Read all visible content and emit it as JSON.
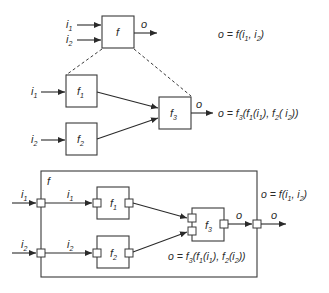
{
  "diagram": {
    "type": "function-composition-block-diagram",
    "panel_top": {
      "block": {
        "label": "f"
      },
      "inputs": [
        {
          "label": "i",
          "sub": "1"
        },
        {
          "label": "i",
          "sub": "2"
        }
      ],
      "output": {
        "label": "o"
      },
      "equation": {
        "lhs": "o = f(",
        "a": "i",
        "a_sub": "1",
        "sep": ", ",
        "b": "i",
        "b_sub": "2",
        "rhs": ")"
      }
    },
    "panel_middle": {
      "blocks": [
        {
          "label": "f",
          "sub": "1"
        },
        {
          "label": "f",
          "sub": "2"
        },
        {
          "label": "f",
          "sub": "3"
        }
      ],
      "inputs": [
        {
          "label": "i",
          "sub": "1"
        },
        {
          "label": "i",
          "sub": "2"
        }
      ],
      "output": {
        "label": "o"
      },
      "equation": "o = f3(f1(i1), f2( i2))"
    },
    "panel_bottom": {
      "outer_block": {
        "label": "f"
      },
      "inner_blocks": [
        {
          "label": "f",
          "sub": "1"
        },
        {
          "label": "f",
          "sub": "2"
        },
        {
          "label": "f",
          "sub": "3"
        }
      ],
      "external_inputs": [
        {
          "label": "i",
          "sub": "1"
        },
        {
          "label": "i",
          "sub": "2"
        }
      ],
      "internal_inputs": [
        {
          "label": "i",
          "sub": "1"
        },
        {
          "label": "i",
          "sub": "2"
        }
      ],
      "internal_output": {
        "label": "o"
      },
      "external_output": {
        "label": "o"
      },
      "outer_equation": "o = f(i1, i2)",
      "inner_equation": "o = f3(f1(i1), f2(i2))"
    }
  }
}
